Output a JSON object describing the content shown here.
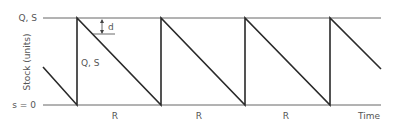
{
  "diagram": {
    "type": "sawtooth-inventory",
    "labels": {
      "top_level": "Q, S",
      "bottom_level": "s = 0",
      "y_axis": "Stock (units)",
      "x_axis": "Time",
      "drop": "Q, S",
      "dimension": "d",
      "period": "R"
    },
    "periods": [
      "R",
      "R",
      "R"
    ],
    "colors": {
      "line": "#2a2a2a",
      "axis": "#666666",
      "text": "#555555"
    }
  }
}
